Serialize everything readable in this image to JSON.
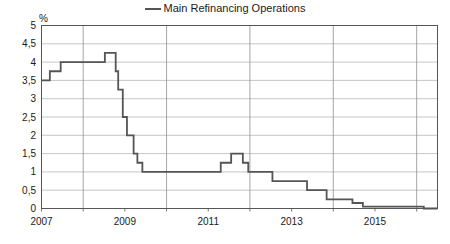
{
  "chart_data": {
    "type": "line",
    "title": "",
    "legend": [
      {
        "name": "Main Refinancing Operations",
        "color": "#555555"
      }
    ],
    "legend_position": "top-center",
    "xlabel": "",
    "ylabel": "%",
    "ylim": [
      0,
      5
    ],
    "xlim": [
      2007.0,
      2016.5
    ],
    "grid": true,
    "ytick_labels": [
      "5",
      "4,5",
      "4",
      "3,5",
      "3",
      "2,5",
      "2",
      "1,5",
      "1",
      "0,5",
      "0"
    ],
    "ytick_values": [
      5,
      4.5,
      4,
      3.5,
      3,
      2.5,
      2,
      1.5,
      1,
      0.5,
      0
    ],
    "xtick_labels": [
      "2007",
      "2009",
      "2011",
      "2013",
      "2015"
    ],
    "xtick_values": [
      2007,
      2009,
      2011,
      2013,
      2015
    ],
    "x_minor_ticks": [
      2008,
      2010,
      2012,
      2014,
      2016
    ],
    "series": [
      {
        "name": "Main Refinancing Operations",
        "interpolation": "step-after",
        "x": [
          2007.0,
          2007.2,
          2007.46,
          2008.52,
          2008.78,
          2008.84,
          2008.95,
          2009.05,
          2009.21,
          2009.3,
          2009.42,
          2011.3,
          2011.55,
          2011.83,
          2011.96,
          2012.54,
          2013.37,
          2013.84,
          2014.46,
          2014.71,
          2016.17,
          2016.5
        ],
        "y": [
          3.5,
          3.75,
          4.0,
          4.25,
          3.75,
          3.25,
          2.5,
          2.0,
          1.5,
          1.25,
          1.0,
          1.25,
          1.5,
          1.25,
          1.0,
          0.75,
          0.5,
          0.25,
          0.15,
          0.05,
          0.0,
          0.0
        ]
      }
    ]
  },
  "axes": {
    "unit": "%"
  }
}
